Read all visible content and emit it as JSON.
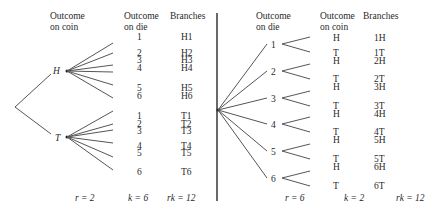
{
  "left_tree": {
    "headers": {
      "coin_line1": "Outcome",
      "coin_line2": "on coin",
      "die_line1": "Outcome",
      "die_line2": "on die",
      "branches": "Branches"
    },
    "first_stage": [
      {
        "label": "H",
        "outcomes": [
          "1",
          "2",
          "3",
          "4",
          "5",
          "6"
        ],
        "branches": [
          "H1",
          "H2",
          "H3",
          "H4",
          "H5",
          "H6"
        ]
      },
      {
        "label": "T",
        "outcomes": [
          "1",
          "2",
          "3",
          "4",
          "5",
          "6"
        ],
        "branches": [
          "T1",
          "T2",
          "T3",
          "T4",
          "T5",
          "T6"
        ]
      }
    ],
    "footer": {
      "r": "r = 2",
      "k": "k = 6",
      "rk": "rk = 12"
    }
  },
  "right_tree": {
    "headers": {
      "die_line1": "Outcome",
      "die_line2": "on die",
      "coin_line1": "Outcome",
      "coin_line2": "on coin",
      "branches": "Branches"
    },
    "first_stage": [
      {
        "label": "1",
        "outcomes": [
          "H",
          "T"
        ],
        "branches": [
          "1H",
          "1T"
        ]
      },
      {
        "label": "2",
        "outcomes": [
          "H",
          "T"
        ],
        "branches": [
          "2H",
          "2T"
        ]
      },
      {
        "label": "3",
        "outcomes": [
          "H",
          "T"
        ],
        "branches": [
          "3H",
          "3T"
        ]
      },
      {
        "label": "4",
        "outcomes": [
          "H",
          "T"
        ],
        "branches": [
          "4H",
          "4T"
        ]
      },
      {
        "label": "5",
        "outcomes": [
          "H",
          "T"
        ],
        "branches": [
          "5H",
          "5T"
        ]
      },
      {
        "label": "6",
        "outcomes": [
          "H",
          "T"
        ],
        "branches": [
          "6H",
          "6T"
        ]
      }
    ],
    "footer": {
      "r": "r = 6",
      "k": "k = 2",
      "rk": "rk = 12"
    }
  }
}
